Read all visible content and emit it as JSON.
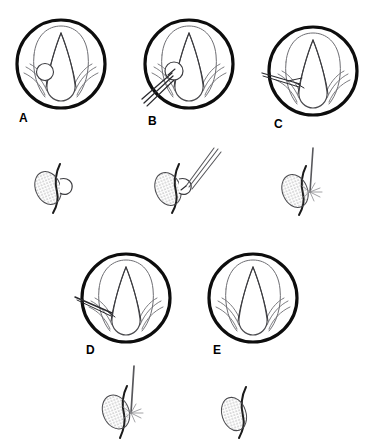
{
  "figure": {
    "background_color": "#ffffff",
    "ink_color": "#0d0d0d",
    "anatomy_line_color": "#6e6e73",
    "instrument_color": "#58585c",
    "label_font_size_px": 12,
    "width_px": 366,
    "height_px": 444
  },
  "panels": [
    {
      "id": "A",
      "label": "A",
      "row": 1,
      "view": "endoscopic-laryngeal-view",
      "caption_position": "below-left",
      "circle": {
        "cx": 60,
        "cy": 63,
        "r": 45,
        "stroke_width": 3.2
      },
      "label_pos": {
        "x": 19,
        "y": 112
      },
      "contents": [
        "vocal-folds",
        "glottis",
        "aryepiglottic-folds",
        "left-cord-lesion"
      ],
      "instrument": "none",
      "lesion_visible": true
    },
    {
      "id": "B",
      "label": "B",
      "row": 1,
      "view": "endoscopic-laryngeal-view",
      "caption_position": "below-left",
      "circle": {
        "cx": 188,
        "cy": 63,
        "r": 45,
        "stroke_width": 3.2
      },
      "label_pos": {
        "x": 148,
        "y": 115
      },
      "contents": [
        "vocal-folds",
        "glottis",
        "aryepiglottic-folds",
        "left-cord-lesion",
        "grasping-forceps"
      ],
      "instrument": "grasping-forceps",
      "lesion_visible": true
    },
    {
      "id": "C",
      "label": "C",
      "row": 1,
      "view": "endoscopic-laryngeal-view",
      "caption_position": "below-left",
      "circle": {
        "cx": 312,
        "cy": 70,
        "r": 45,
        "stroke_width": 3.2
      },
      "label_pos": {
        "x": 274,
        "y": 118
      },
      "contents": [
        "vocal-folds",
        "glottis",
        "aryepiglottic-folds",
        "microscissors"
      ],
      "instrument": "microscissors",
      "lesion_visible": false
    },
    {
      "id": "D",
      "label": "D",
      "row": 2,
      "view": "endoscopic-laryngeal-view",
      "caption_position": "below-left",
      "circle": {
        "cx": 125,
        "cy": 297,
        "r": 45,
        "stroke_width": 3.2
      },
      "label_pos": {
        "x": 86,
        "y": 344
      },
      "contents": [
        "vocal-folds",
        "glottis",
        "aryepiglottic-folds",
        "laser-probe"
      ],
      "instrument": "laser-probe",
      "lesion_visible": false
    },
    {
      "id": "E",
      "label": "E",
      "row": 2,
      "view": "endoscopic-laryngeal-view",
      "caption_position": "below-left",
      "circle": {
        "cx": 252,
        "cy": 297,
        "r": 45,
        "stroke_width": 3.2
      },
      "label_pos": {
        "x": 213,
        "y": 344
      },
      "contents": [
        "vocal-folds",
        "glottis",
        "aryepiglottic-folds"
      ],
      "instrument": "none",
      "lesion_visible": false
    }
  ],
  "side_views": [
    {
      "id": "A-side",
      "for_panel": "A",
      "row": 1,
      "origin": {
        "x": 33,
        "y": 160
      },
      "lesion": {
        "shape": "stippled-ellipse",
        "rx": 13,
        "ry": 18,
        "rotation_deg": -22
      },
      "features": [
        "cord-edge-line",
        "pedunculated-polyp-loop"
      ],
      "instrument": "none"
    },
    {
      "id": "B-side",
      "for_panel": "B",
      "row": 1,
      "origin": {
        "x": 155,
        "y": 150
      },
      "lesion": {
        "shape": "stippled-ellipse",
        "rx": 13,
        "ry": 18,
        "rotation_deg": -22
      },
      "features": [
        "cord-edge-line",
        "pedunculated-polyp-loop"
      ],
      "instrument": "grasping-forceps"
    },
    {
      "id": "C-side",
      "for_panel": "C",
      "row": 1,
      "origin": {
        "x": 283,
        "y": 150
      },
      "lesion": {
        "shape": "stippled-ellipse",
        "rx": 13,
        "ry": 18,
        "rotation_deg": -22
      },
      "features": [
        "cord-edge-line",
        "spark-burst"
      ],
      "instrument": "laser-probe"
    },
    {
      "id": "D-side",
      "for_panel": "D",
      "row": 2,
      "origin": {
        "x": 104,
        "y": 370
      },
      "lesion": {
        "shape": "stippled-ellipse",
        "rx": 13,
        "ry": 18,
        "rotation_deg": -22
      },
      "features": [
        "cord-edge-line",
        "spark-burst"
      ],
      "instrument": "laser-probe"
    },
    {
      "id": "E-side",
      "for_panel": "E",
      "row": 2,
      "origin": {
        "x": 222,
        "y": 388
      },
      "lesion": {
        "shape": "stippled-ellipse",
        "rx": 12,
        "ry": 17,
        "rotation_deg": -18
      },
      "features": [
        "cord-edge-line"
      ],
      "instrument": "none"
    }
  ]
}
